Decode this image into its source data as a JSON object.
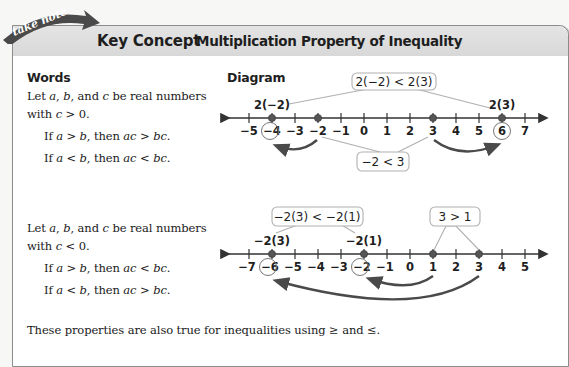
{
  "banner": {
    "tag": "take note",
    "label": "Key Concept",
    "title": "Multiplication Property of Inequality"
  },
  "headings": {
    "words": "Words",
    "diagram": "Diagram"
  },
  "positive_case": {
    "intro_line1": "Let a, b, and c be real numbers",
    "intro_line2": "with c > 0.",
    "rule1": "If a > b, then ac > bc.",
    "rule2": "If a < b, then ac < bc."
  },
  "negative_case": {
    "intro_line1": "Let a, b, and c be real numbers",
    "intro_line2": "with c < 0.",
    "rule1": "If a > b, then ac < bc.",
    "rule2": "If a < b, then ac > bc."
  },
  "footer": "These properties are also true for inequalities using ≥ and ≤.",
  "diagram1": {
    "ticks": [
      "−5",
      "−4",
      "−3",
      "−2",
      "−1",
      "0",
      "1",
      "2",
      "3",
      "4",
      "5",
      "6",
      "7"
    ],
    "points": [
      "−2",
      "3",
      "−4",
      "6"
    ],
    "circled": [
      "−4",
      "6"
    ],
    "point_labels": [
      "2(−2)",
      "2(3)"
    ],
    "callout_top": "2(−2) < 2(3)",
    "callout_bottom": "−2 < 3"
  },
  "diagram2": {
    "ticks": [
      "−7",
      "−6",
      "−5",
      "−4",
      "−3",
      "−2",
      "−1",
      "0",
      "1",
      "2",
      "3",
      "4",
      "5"
    ],
    "points": [
      "1",
      "3",
      "−2",
      "−6"
    ],
    "circled": [
      "−6",
      "−2"
    ],
    "point_labels": [
      "−2(3)",
      "−2(1)"
    ],
    "callout_top_left": "−2(3) < −2(1)",
    "callout_top_right": "3 > 1"
  },
  "colors": {
    "banner_ribbon": "#4a4a4a",
    "title_bar": "#dcdcdc",
    "point": "#555555",
    "arrow": "#4a4a4a",
    "callout_border": "#b0b0b0"
  }
}
